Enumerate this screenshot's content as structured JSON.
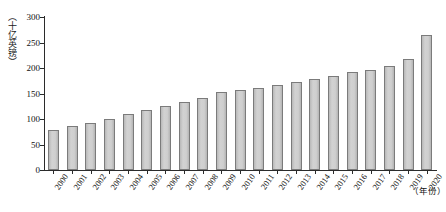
{
  "chart_data": {
    "type": "bar",
    "title": "",
    "xlabel": "（年份）",
    "ylabel": "（十亿英镑）",
    "ylim": [
      0,
      300
    ],
    "yticks": [
      0,
      50,
      100,
      150,
      200,
      250,
      300
    ],
    "ytick_labels": [
      "0",
      "50",
      "100",
      "150",
      "200",
      "250",
      "300"
    ],
    "grid": false,
    "legend": null,
    "bar_color": "#c9c9c9",
    "bar_edge_color": "#7b7b7b",
    "axis_color": "#2b2b2b",
    "categories": [
      "2000",
      "2001",
      "2002",
      "2003",
      "2004",
      "2005",
      "2006",
      "2007",
      "2008",
      "2009",
      "2010",
      "2011",
      "2012",
      "2013",
      "2014",
      "2015",
      "2016",
      "2017",
      "2018",
      "2019",
      "2020"
    ],
    "values": [
      78,
      86,
      93,
      101,
      110,
      118,
      126,
      133,
      141,
      152,
      156,
      160,
      166,
      172,
      178,
      184,
      192,
      196,
      204,
      218,
      265
    ]
  }
}
